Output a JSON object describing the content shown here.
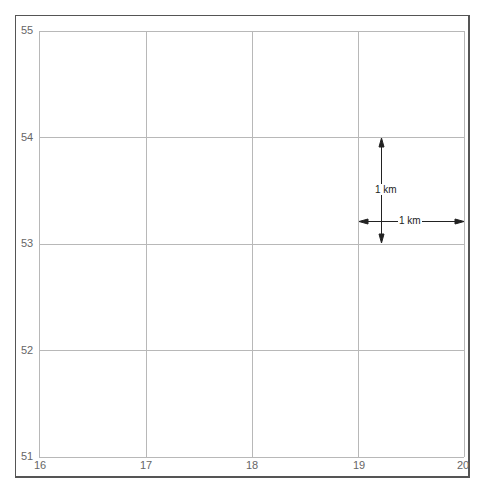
{
  "grid": {
    "x_labels": [
      "16",
      "17",
      "18",
      "19",
      "20"
    ],
    "y_labels": [
      "55",
      "54",
      "53",
      "52",
      "51"
    ],
    "x_positions": [
      39,
      146,
      252,
      358,
      464
    ],
    "y_positions": [
      31,
      137,
      244,
      350,
      457
    ],
    "line_color": "#b0b0b0"
  },
  "scale": {
    "vertical_label": "1 km",
    "horizontal_label": "1 km"
  }
}
